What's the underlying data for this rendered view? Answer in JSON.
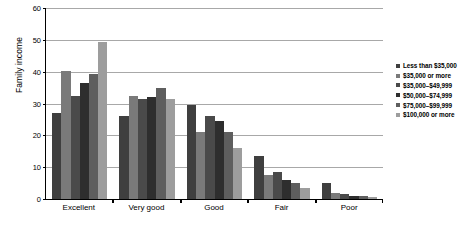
{
  "chart_data": {
    "type": "bar",
    "title": "",
    "xlabel": "",
    "ylabel": "Family income",
    "ylim": [
      0,
      60
    ],
    "yticks": [
      0,
      10,
      20,
      30,
      40,
      50,
      60
    ],
    "grid": true,
    "legend_position": "right",
    "categories": [
      "Excellent",
      "Very good",
      "Good",
      "Fair",
      "Poor"
    ],
    "series": [
      {
        "name": "Less than $35,000",
        "color": "#3f3f3f",
        "values": [
          27,
          26,
          29.5,
          13.5,
          5
        ]
      },
      {
        "name": "$35,000 or more",
        "color": "#7a7a7a",
        "values": [
          40.3,
          32.5,
          21,
          7.5,
          2
        ]
      },
      {
        "name": "$35,000–$49,999",
        "color": "#4a4a4a",
        "values": [
          32.4,
          31.4,
          26,
          8.5,
          1.5
        ]
      },
      {
        "name": "$50,000–$74,999",
        "color": "#2e2e2e",
        "values": [
          36.5,
          32,
          24.5,
          6,
          1
        ]
      },
      {
        "name": "$75,000–$99,999",
        "color": "#5e5e5e",
        "values": [
          39.2,
          35,
          21,
          5,
          0.8
        ]
      },
      {
        "name": "$100,000 or more",
        "color": "#9d9d9d",
        "values": [
          49.4,
          31.5,
          16,
          3.5,
          0.5
        ]
      }
    ]
  }
}
